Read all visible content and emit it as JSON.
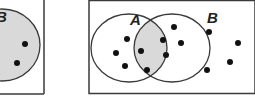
{
  "colors": {
    "outline": "#3a3a3a",
    "shade": "#d9d9d9",
    "dot": "#111111",
    "background": "#ffffff"
  },
  "left_diagram": {
    "set_label": "B",
    "shaded_region": "B",
    "dots_visible": 2
  },
  "right_diagram": {
    "sets": [
      {
        "label": "A",
        "dots_only_in_A": 5
      },
      {
        "label": "B",
        "dots_only_in_B": 4
      }
    ],
    "intersection_dots": 4,
    "shaded_region": "A ∩ B"
  }
}
